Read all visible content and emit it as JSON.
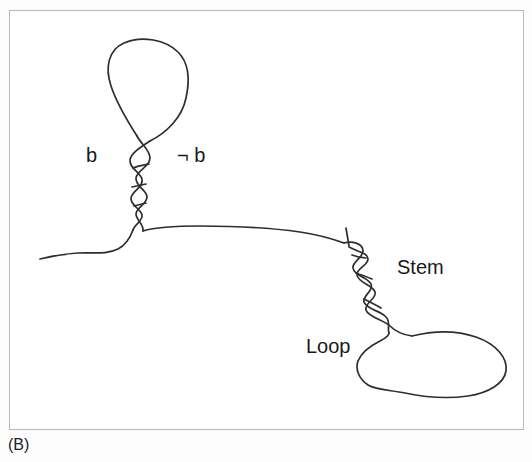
{
  "figure": {
    "caption": "(B)",
    "frame": {
      "x": 9,
      "y": 10,
      "width": 515,
      "height": 420,
      "border_color": "#b9b9b9",
      "background_color": "#ffffff"
    },
    "stroke_color": "#2e2e2e",
    "labels": {
      "left_strand": "b",
      "right_strand": "¬ b",
      "stem": "Stem",
      "loop": "Loop"
    }
  },
  "diagram_data": {
    "type": "schematic",
    "subject": "nucleic-acid stem-loop (hairpin) secondary structure",
    "elements": [
      {
        "name": "upper-hairpin-loop",
        "kind": "closed-loop",
        "description": "teardrop / pear shaped loop at top of the upper helix",
        "approx_bounds": {
          "x": 106,
          "y": 40,
          "width": 82,
          "height": 105
        }
      },
      {
        "name": "upper-helix",
        "kind": "double-helix",
        "description": "vertical twisted duplex below the upper loop, labelled b on the left and not-b on the right",
        "approx_bounds": {
          "x": 122,
          "y": 132,
          "width": 26,
          "height": 92
        },
        "turns": 4
      },
      {
        "name": "left-single-strand",
        "kind": "single-strand",
        "description": "free strand tail running left from the base of the upper helix",
        "approx_bounds": {
          "x": 40,
          "y": 222,
          "width": 95,
          "height": 38
        }
      },
      {
        "name": "connecting-single-strand",
        "kind": "single-strand",
        "description": "long nearly-horizontal strand joining the upper helix base to the stem",
        "approx_bounds": {
          "x": 134,
          "y": 222,
          "width": 206,
          "height": 22
        }
      },
      {
        "name": "stem-helix",
        "kind": "double-helix",
        "description": "diagonal twisted duplex descending to the right, labelled Stem",
        "approx_bounds": {
          "x": 340,
          "y": 228,
          "width": 90,
          "height": 92
        },
        "turns": 5
      },
      {
        "name": "lower-loop",
        "kind": "closed-loop",
        "description": "large irregular rounded loop at bottom right, labelled Loop",
        "approx_bounds": {
          "x": 355,
          "y": 310,
          "width": 152,
          "height": 88
        }
      }
    ],
    "annotations": [
      {
        "text": "b",
        "x": 86,
        "y": 145,
        "points_to": "upper-helix-left-strand"
      },
      {
        "text": "¬ b",
        "x": 177,
        "y": 145,
        "points_to": "upper-helix-right-strand"
      },
      {
        "text": "Stem",
        "x": 397,
        "y": 257,
        "points_to": "stem-helix"
      },
      {
        "text": "Loop",
        "x": 306,
        "y": 336,
        "points_to": "lower-loop"
      }
    ]
  }
}
